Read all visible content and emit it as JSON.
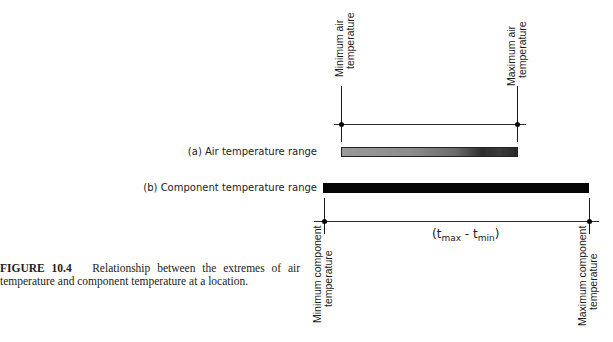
{
  "figure": {
    "number": "FIGURE 10.4",
    "caption": "Relationship between the extremes of air temperature and component temperature at a location."
  },
  "air_range": {
    "label": "(a) Air temperature range",
    "min_label_line1": "Minimum air",
    "min_label_line2": "temperature",
    "max_label_line1": "Maximum air",
    "max_label_line2": "temperature",
    "bar_style": "gray-gradient"
  },
  "component_range": {
    "label": "(b) Component temperature range",
    "min_label_line1": "Minimum component",
    "min_label_line2": "temperature",
    "max_label_line1": "Maximum component",
    "max_label_line2": "temperature",
    "bar_style": "solid-black",
    "span_formula": {
      "open": "(t",
      "max_sub": "max",
      "minus": " - t",
      "min_sub": "min",
      "close": ")"
    }
  },
  "colors": {
    "line": "#1a1a1a",
    "black_bar": "#050505",
    "gray_bar": "#8c8c8c"
  }
}
